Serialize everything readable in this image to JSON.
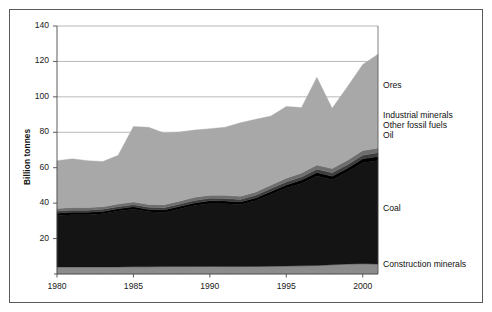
{
  "chart_data": {
    "type": "area",
    "stacked": true,
    "title": "",
    "xlabel": "",
    "ylabel": "Billion tonnes",
    "xlim": [
      1980,
      2001
    ],
    "ylim": [
      0,
      140
    ],
    "ytick_step": 20,
    "grid": true,
    "legend_position": "right-inline",
    "x": [
      1980,
      1981,
      1982,
      1983,
      1984,
      1985,
      1986,
      1987,
      1988,
      1989,
      1990,
      1991,
      1992,
      1993,
      1994,
      1995,
      1996,
      1997,
      1998,
      1999,
      2000,
      2001
    ],
    "xticks": [
      "1980",
      "1985",
      "1990",
      "1995",
      "2000"
    ],
    "yticks": [
      "20",
      "40",
      "60",
      "80",
      "100",
      "120",
      "140"
    ],
    "series": [
      {
        "name": "Construction minerals",
        "color": "#8c8c8c",
        "values": [
          4.0,
          4.0,
          4.0,
          4.0,
          4.0,
          4.1,
          4.1,
          4.2,
          4.2,
          4.2,
          4.3,
          4.2,
          4.2,
          4.3,
          4.4,
          4.5,
          4.6,
          4.8,
          5.2,
          5.6,
          5.8,
          5.6
        ]
      },
      {
        "name": "Coal",
        "color": "#141414",
        "values": [
          29.0,
          29.5,
          29.5,
          30.0,
          31.5,
          32.5,
          31.0,
          30.5,
          32.5,
          34.5,
          35.5,
          35.5,
          35.0,
          37.0,
          40.5,
          44.0,
          46.5,
          50.5,
          48.0,
          52.0,
          57.0,
          58.5
        ]
      },
      {
        "name": "Oil",
        "color": "#000000",
        "values": [
          1.3,
          1.3,
          1.3,
          1.3,
          1.3,
          1.3,
          1.3,
          1.4,
          1.4,
          1.4,
          1.5,
          1.5,
          1.5,
          1.6,
          1.7,
          1.8,
          1.9,
          2.0,
          2.0,
          2.1,
          2.2,
          2.2
        ]
      },
      {
        "name": "Other fossil fuels",
        "color": "#3d3d3d",
        "values": [
          1.2,
          1.2,
          1.2,
          1.2,
          1.2,
          1.2,
          1.3,
          1.3,
          1.3,
          1.4,
          1.4,
          1.4,
          1.4,
          1.5,
          1.6,
          1.7,
          1.8,
          1.9,
          1.9,
          2.0,
          2.1,
          2.1
        ]
      },
      {
        "name": "Industrial minerals",
        "color": "#6e6e6e",
        "values": [
          1.5,
          1.5,
          1.5,
          1.5,
          1.5,
          1.6,
          1.6,
          1.7,
          1.7,
          1.8,
          1.8,
          1.8,
          1.8,
          1.9,
          2.0,
          2.1,
          2.2,
          2.3,
          2.4,
          2.5,
          2.6,
          2.7
        ]
      },
      {
        "name": "Ores",
        "color": "#a8a8a8",
        "values": [
          27.0,
          27.5,
          26.5,
          25.5,
          27.5,
          42.5,
          43.5,
          40.5,
          39.0,
          38.0,
          37.5,
          38.5,
          41.5,
          41.0,
          39.0,
          40.5,
          37.0,
          49.5,
          34.0,
          41.5,
          48.5,
          53.0
        ]
      }
    ],
    "series_totals": [
      64.0,
      65.0,
      64.0,
      63.5,
      67.0,
      83.2,
      82.8,
      80.6,
      81.1,
      83.3,
      82.0,
      82.9,
      85.4,
      87.3,
      89.2,
      94.6,
      94.0,
      111.0,
      93.5,
      105.7,
      118.2,
      124.1
    ],
    "series_label_positions": [
      {
        "name": "Ores",
        "label": "Ores",
        "top": 80
      },
      {
        "name": "Industrial minerals",
        "label": "Industrial minerals",
        "top": 110
      },
      {
        "name": "Other fossil fuels",
        "label": "Other fossil fuels",
        "top": 120
      },
      {
        "name": "Oil",
        "label": "Oil",
        "top": 130
      },
      {
        "name": "Coal",
        "label": "Coal",
        "top": 203
      },
      {
        "name": "Construction minerals",
        "label": "Construction minerals",
        "top": 259
      }
    ],
    "geometry": {
      "plot_left": 57,
      "plot_right": 378,
      "plot_top": 26,
      "plot_bottom": 274,
      "gridline_color": "#9a9a9a",
      "axis_color": "#4a4a4a",
      "background": "#ffffff",
      "frame_color": "#5a5a5a"
    }
  },
  "axis": {
    "y_title": "Billion tonnes"
  }
}
